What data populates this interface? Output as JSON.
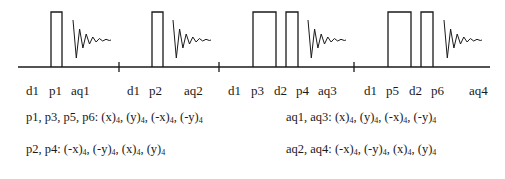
{
  "diagram": {
    "baseline": {
      "x1": 18,
      "x2": 490,
      "y": 67
    },
    "ticks": [
      119,
      219,
      354
    ],
    "pulses": [
      {
        "name": "p1",
        "x": 51,
        "w": 11
      },
      {
        "name": "p2",
        "x": 152,
        "w": 11
      },
      {
        "name": "p3",
        "x": 253,
        "w": 23
      },
      {
        "name": "p4",
        "x": 286,
        "w": 12
      },
      {
        "name": "p5",
        "x": 388,
        "w": 23
      },
      {
        "name": "p6",
        "x": 421,
        "w": 12
      }
    ],
    "pulse_top": 12,
    "fids": [
      {
        "name": "aq1",
        "x": 73
      },
      {
        "name": "aq2",
        "x": 173
      },
      {
        "name": "aq3",
        "x": 308
      },
      {
        "name": "aq4",
        "x": 444
      }
    ],
    "labels": [
      {
        "text": "d1",
        "x": 26
      },
      {
        "text": "p1",
        "x": 49
      },
      {
        "text": "aq1",
        "x": 71
      },
      {
        "text": "d1",
        "x": 127
      },
      {
        "text": "p2",
        "x": 149
      },
      {
        "text": "aq2",
        "x": 184
      },
      {
        "text": "d1",
        "x": 228
      },
      {
        "text": "p3",
        "x": 251
      },
      {
        "text": "d2",
        "x": 274
      },
      {
        "text": "p4",
        "x": 296
      },
      {
        "text": "aq3",
        "x": 318
      },
      {
        "text": "d1",
        "x": 364
      },
      {
        "text": "p5",
        "x": 386
      },
      {
        "text": "d2",
        "x": 409
      },
      {
        "text": "p6",
        "x": 431
      },
      {
        "text": "aq4",
        "x": 469
      }
    ],
    "label_y": 84
  },
  "phase_cycles": [
    {
      "label": "p1, p3, p5, p6:",
      "items": [
        [
          "(x)",
          "4"
        ],
        [
          "(y)",
          "4"
        ],
        [
          "(-x)",
          "4"
        ],
        [
          "(-y)",
          "4"
        ]
      ],
      "x": 26,
      "y": 122
    },
    {
      "label": "p2, p4:",
      "items": [
        [
          "(-x)",
          "4"
        ],
        [
          "(-y)",
          "4"
        ],
        [
          "(x)",
          "4"
        ],
        [
          "(y)",
          "4"
        ]
      ],
      "x": 26,
      "y": 154
    },
    {
      "label": "aq1, aq3:",
      "items": [
        [
          "(x)",
          "4"
        ],
        [
          "(y)",
          "4"
        ],
        [
          "(-x)",
          "4"
        ],
        [
          "(-y)",
          "4"
        ]
      ],
      "x": 286,
      "y": 122
    },
    {
      "label": "aq2, aq4:",
      "items": [
        [
          "(-x)",
          "4"
        ],
        [
          "(-y)",
          "4"
        ],
        [
          "(x)",
          "4"
        ],
        [
          "(y)",
          "4"
        ]
      ],
      "x": 286,
      "y": 154
    }
  ]
}
